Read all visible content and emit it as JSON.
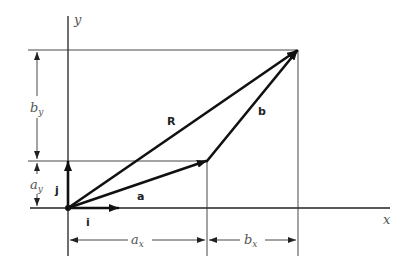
{
  "diagram": {
    "type": "vector-addition",
    "axes": {
      "x_label": "x",
      "y_label": "y"
    },
    "unit_vectors": {
      "i_label": "i",
      "j_label": "j"
    },
    "vectors": {
      "a_label": "a",
      "b_label": "b",
      "R_label": "R"
    },
    "dimensions": {
      "ax_label": "a",
      "ax_sub": "x",
      "bx_label": "b",
      "bx_sub": "x",
      "ay_label": "a",
      "ay_sub": "y",
      "by_label": "b",
      "by_sub": "y"
    },
    "points": {
      "origin": [
        68,
        208
      ],
      "a_tip": [
        207,
        161
      ],
      "R_tip": [
        298,
        50
      ]
    }
  }
}
